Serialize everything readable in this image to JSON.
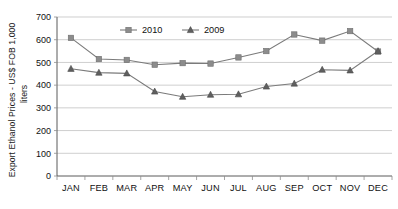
{
  "chart_data": {
    "type": "line",
    "title": "",
    "xlabel": "",
    "ylabel": "Export Ethanol Prices - US$ FOB 1,000 liters",
    "ylabel_line1": "Export Ethanol Prices - US$ FOB 1,000",
    "ylabel_line2": "liters",
    "categories": [
      "JAN",
      "FEB",
      "MAR",
      "APR",
      "MAY",
      "JUN",
      "JUL",
      "AUG",
      "SEP",
      "OCT",
      "NOV",
      "DEC"
    ],
    "ylim": [
      0,
      700
    ],
    "yticks": [
      700,
      600,
      500,
      400,
      300,
      200,
      100,
      0
    ],
    "grid": true,
    "legend_position": "top-center",
    "series": [
      {
        "name": "2010",
        "marker": "square",
        "color": "#8c8c8c",
        "values": [
          608,
          515,
          511,
          490,
          497,
          495,
          522,
          550,
          623,
          596,
          638,
          548
        ]
      },
      {
        "name": "2009",
        "marker": "triangle",
        "color": "#5f5f5f",
        "values": [
          472,
          455,
          452,
          372,
          349,
          358,
          360,
          394,
          407,
          468,
          465,
          550
        ]
      }
    ]
  },
  "legend": {
    "entries": [
      {
        "label": "2010"
      },
      {
        "label": "2009"
      }
    ]
  }
}
